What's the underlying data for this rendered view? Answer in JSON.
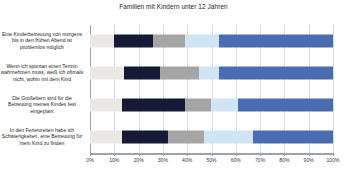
{
  "chart_data": {
    "type": "bar",
    "orientation": "horizontal",
    "stacked": true,
    "normalized_percent": true,
    "title": "Familien mit Kindern unter 12 Jahren",
    "xlabel": "",
    "ylabel": "",
    "xlim": [
      0,
      100
    ],
    "grid": true,
    "legend_position": "none",
    "xticks": [
      "0%",
      "10%",
      "20%",
      "30%",
      "40%",
      "50%",
      "60%",
      "70%",
      "80%",
      "90%",
      "100%"
    ],
    "xtick_values": [
      0,
      10,
      20,
      30,
      40,
      50,
      60,
      70,
      80,
      90,
      100
    ],
    "categories": [
      "Eine Kinderbetreuung von morgens bis in den frühen Abend ist problemlos möglich",
      "Wenn ich spontan einen Termin wahrnehmen muss, weiß ich oftmals nicht, wohin mit dem Kind",
      "Die Großeltern sind für die Betreuung meines Kindes fest eingeplant",
      "In den Ferienzeiten habe ich Schwierigkeiten, eine Betreuung für mein Kind zu finden"
    ],
    "series": [
      {
        "name": "Segment 1",
        "color": "#ece7e2",
        "values": [
          10,
          14,
          13,
          13
        ]
      },
      {
        "name": "Segment 2",
        "color": "#151a37",
        "values": [
          16,
          15,
          26,
          19
        ]
      },
      {
        "name": "Segment 3",
        "color": "#a5a5a5",
        "values": [
          13,
          16,
          11,
          15
        ]
      },
      {
        "name": "Segment 4",
        "color": "#cfe5f5",
        "values": [
          14,
          8,
          11,
          20
        ]
      },
      {
        "name": "Segment 5",
        "color": "#4a6cb3",
        "values": [
          47,
          47,
          39,
          33
        ]
      }
    ],
    "colors": {
      "grid": "#d4d9e2",
      "axis": "#9aa3b0",
      "text": "#262626",
      "background": "#ffffff"
    }
  }
}
